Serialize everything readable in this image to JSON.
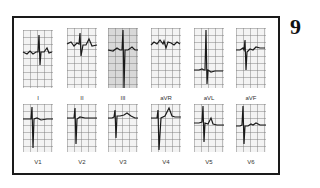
{
  "figure": {
    "number": "9"
  },
  "rows": [
    {
      "leads": [
        {
          "label": "I"
        },
        {
          "label": "II"
        },
        {
          "label": "III"
        },
        {
          "label": "aVR"
        },
        {
          "label": "aVL"
        },
        {
          "label": "aVF"
        }
      ]
    },
    {
      "leads": [
        {
          "label": "V1"
        },
        {
          "label": "V2"
        },
        {
          "label": "V3"
        },
        {
          "label": "V4"
        },
        {
          "label": "V5"
        },
        {
          "label": "V6"
        }
      ]
    }
  ],
  "colors": {
    "trace": "#1a1a1a",
    "grid": "#8a8a8a",
    "frame": "#1a1a1a"
  }
}
